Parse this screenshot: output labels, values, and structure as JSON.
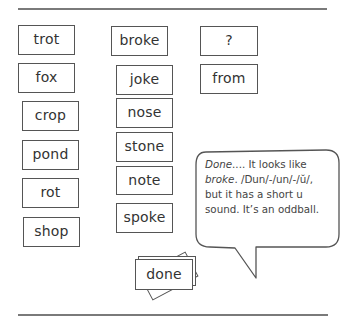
{
  "columns": [
    {
      "name": "short-o",
      "cards": [
        {
          "word": "trot",
          "x": 18,
          "y": 25,
          "w": 57,
          "h": 30
        },
        {
          "word": "fox",
          "x": 18,
          "y": 63,
          "w": 57,
          "h": 30
        },
        {
          "word": "crop",
          "x": 22,
          "y": 101,
          "w": 57,
          "h": 30
        },
        {
          "word": "pond",
          "x": 22,
          "y": 140,
          "w": 57,
          "h": 30
        },
        {
          "word": "rot",
          "x": 22,
          "y": 178,
          "w": 57,
          "h": 30
        },
        {
          "word": "shop",
          "x": 23,
          "y": 217,
          "w": 57,
          "h": 30
        }
      ]
    },
    {
      "name": "long-o",
      "cards": [
        {
          "word": "broke",
          "x": 111,
          "y": 26,
          "w": 57,
          "h": 30
        },
        {
          "word": "joke",
          "x": 116,
          "y": 65,
          "w": 57,
          "h": 30
        },
        {
          "word": "nose",
          "x": 116,
          "y": 98,
          "w": 57,
          "h": 30
        },
        {
          "word": "stone",
          "x": 116,
          "y": 132,
          "w": 57,
          "h": 30
        },
        {
          "word": "note",
          "x": 116,
          "y": 166,
          "w": 57,
          "h": 29
        },
        {
          "word": "spoke",
          "x": 116,
          "y": 203,
          "w": 57,
          "h": 30
        }
      ]
    },
    {
      "name": "oddball",
      "cards": [
        {
          "word": "?",
          "x": 200,
          "y": 26,
          "w": 58,
          "h": 30
        },
        {
          "word": "from",
          "x": 200,
          "y": 64,
          "w": 58,
          "h": 30
        }
      ]
    }
  ],
  "speech_bubble": {
    "lead_word": "Done",
    "line1_rest": ".... It looks like",
    "line2_italic": "broke",
    "line2_rest": ". /Dun/-/un/-/ŭ/,",
    "line3": "but it has a short u",
    "line4": "sound. It’s an oddball."
  },
  "sorting_card": {
    "word": "done",
    "x": 135,
    "y": 258,
    "w": 58,
    "h": 31
  },
  "colors": {
    "line": "#7a7a7a",
    "border": "#555555",
    "text": "#333333"
  }
}
